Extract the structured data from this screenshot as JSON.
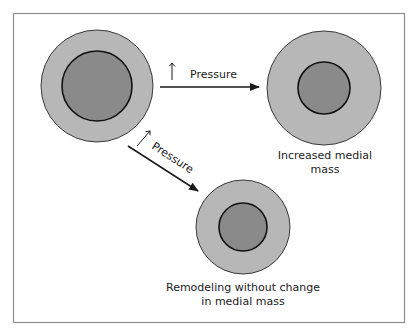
{
  "diagram": {
    "type": "arterial remodeling schematic",
    "colors": {
      "frame": "#8c8c8c",
      "outer_ring": "#b7b7b7",
      "inner_core": "#8a8a8a",
      "stroke": "#1a1a1a",
      "text": "#222222"
    },
    "vessels": [
      {
        "id": "baseline",
        "outer_radius": 56,
        "inner_radius": 35,
        "caption_lines": []
      },
      {
        "id": "increased-medial-mass",
        "outer_radius": 57,
        "inner_radius": 26,
        "caption_lines": [
          "Increased medial",
          "mass"
        ]
      },
      {
        "id": "remodeling-no-change",
        "outer_radius": 47,
        "inner_radius": 24,
        "caption_lines": [
          "Remodeling without change",
          "in medial mass"
        ]
      }
    ],
    "arrows": [
      {
        "id": "horizontal-pressure",
        "label": "Pressure",
        "indicator": "increase-arrow"
      },
      {
        "id": "diagonal-pressure",
        "label": "Pressure",
        "indicator": "increase-arrow"
      }
    ]
  }
}
